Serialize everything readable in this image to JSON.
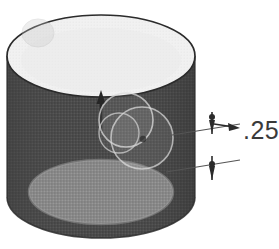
{
  "figure": {
    "background_color": "#ffffff",
    "type": "engineering-illustration"
  },
  "cylinder": {
    "name": "cylinder-solid",
    "top_face_color": "#f1f1f1",
    "body_color": "#4c4c4c",
    "body_shadow_color": "#3f3f3f",
    "inner_floor_color": "#8a8a8a",
    "outline_color": "#2b2b2b",
    "top_center_x": 101,
    "top_center_y": 56,
    "top_radius_x": 94,
    "top_radius_y": 41,
    "bottom_center_x": 101,
    "bottom_center_y": 197,
    "bottom_radius_x": 94,
    "bottom_radius_y": 41,
    "inner_floor_center_x": 101,
    "inner_floor_center_y": 192,
    "inner_floor_radius_x": 72,
    "inner_floor_radius_y": 32
  },
  "center_arrow": {
    "name": "center-up-arrow",
    "direction": "up",
    "color": "#262626",
    "tip_x": 101,
    "tip_y": 93,
    "tail_x": 101,
    "tail_y": 132
  },
  "dimension": {
    "name": "dimension-callout",
    "label": ".25",
    "label_x": 240,
    "label_y": 140,
    "line_color": "#555555",
    "arrow_color": "#2b2b2b",
    "upper_extension": {
      "start_x": 168,
      "start_y": 134,
      "end_x": 238,
      "end_y": 125
    },
    "lower_extension": {
      "start_x": 168,
      "start_y": 170,
      "end_x": 238,
      "end_y": 161
    },
    "upper_tick_x": 212,
    "upper_tick_y": 118,
    "lower_tick_x": 212,
    "lower_tick_y": 169,
    "leader_arrow_tip_x": 235,
    "leader_arrow_tip_y": 127
  },
  "artifacts": [
    {
      "name": "scan-blob-top-left",
      "cx": 38,
      "cy": 33,
      "rx": 16,
      "ry": 14,
      "opacity": 0.3
    },
    {
      "name": "scan-ring-center-a",
      "cx": 126,
      "cy": 120,
      "r": 27,
      "opacity": 0.35
    },
    {
      "name": "scan-ring-center-b",
      "cx": 142,
      "cy": 138,
      "r": 31,
      "opacity": 0.32
    },
    {
      "name": "scan-ring-center-c",
      "cx": 119,
      "cy": 133,
      "r": 20,
      "opacity": 0.3
    },
    {
      "name": "scan-dot-center",
      "cx": 143,
      "cy": 139,
      "r": 3,
      "opacity": 0.75
    }
  ]
}
